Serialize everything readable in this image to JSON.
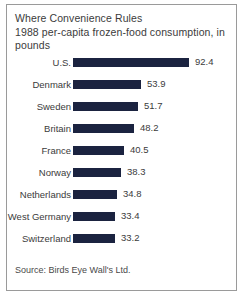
{
  "card": {
    "title_lines": [
      "Where Convenience Rules",
      "1988 per-capita frozen-food consumption, in",
      "pounds"
    ],
    "source": "Source: Birds Eye Wall's Ltd."
  },
  "chart_data": {
    "type": "bar",
    "orientation": "horizontal",
    "title": "Where Convenience Rules",
    "subtitle": "1988 per-capita frozen-food consumption, in pounds",
    "xlabel": "",
    "ylabel": "",
    "unit": "pounds",
    "grid": false,
    "legend": null,
    "xlim": [
      0,
      92.4
    ],
    "bar_color": "#1b2340",
    "categories": [
      "U.S.",
      "Denmark",
      "Sweden",
      "Britain",
      "France",
      "Norway",
      "Netherlands",
      "West Germany",
      "Switzerland"
    ],
    "values": [
      92.4,
      53.9,
      51.7,
      48.2,
      40.5,
      38.3,
      34.8,
      33.4,
      33.2
    ],
    "value_labels": [
      "92.4",
      "53.9",
      "51.7",
      "48.2",
      "40.5",
      "38.3",
      "34.8",
      "33.4",
      "33.2"
    ],
    "source": "Source: Birds Eye Wall's Ltd."
  }
}
